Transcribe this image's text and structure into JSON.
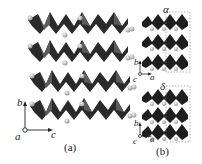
{
  "panel_a": {
    "caption": "(a)",
    "axes": {
      "up": "b",
      "right": "c",
      "out": "a"
    },
    "layers": 4
  },
  "panel_b": {
    "caption": "(b)",
    "top": {
      "label": "α",
      "axes": {
        "up": "b",
        "right": "a",
        "out": "c"
      },
      "rows": 3
    },
    "bottom": {
      "label": "δ",
      "axes": {
        "up": "b",
        "right": "a",
        "out": "c"
      },
      "rows": 3
    }
  },
  "colors": {
    "polyhedra": "#2a2a2a",
    "polyhedra_light": "#555555",
    "sphere": "#c8c8c8",
    "dashed": "#888888"
  }
}
